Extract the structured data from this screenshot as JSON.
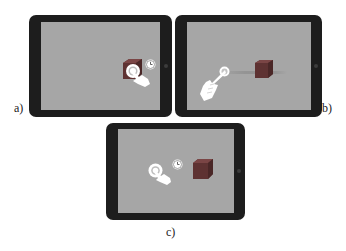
{
  "panels": [
    {
      "id": "a",
      "label": "a)",
      "description": "tap and hold on cube (clock indicator)"
    },
    {
      "id": "b",
      "label": "b)",
      "description": "drag cube with finger"
    },
    {
      "id": "c",
      "label": "c)",
      "description": "tap and hold on empty space (clock indicator)"
    }
  ],
  "colors": {
    "frame": "#1d1d1d",
    "screen": "#a6a6a6",
    "cube": "#6e3b3b",
    "hand": "#ffffff"
  }
}
